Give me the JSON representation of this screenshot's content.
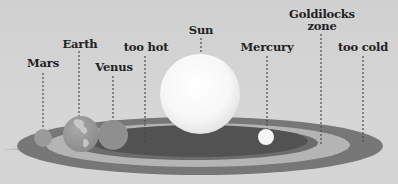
{
  "diagram": {
    "type": "solar-system-habitable-zone",
    "colors": {
      "background": "#d3d3d3",
      "outer_ring": "#787878",
      "goldilocks_band": "#b5b5b5",
      "inner_zone": "#545454",
      "sun": "#ffffff",
      "mercury": "#f4f4f4",
      "venus": "#8f8f8f",
      "earth": "#a0a0a0",
      "mars": "#9b9b9b",
      "leader_line": "#555555"
    },
    "labels": {
      "mars": "Mars",
      "earth": "Earth",
      "venus": "Venus",
      "too_hot": "too hot",
      "sun": "Sun",
      "mercury": "Mercury",
      "goldilocks_line1": "Goldilocks",
      "goldilocks_line2": "zone",
      "too_cold": "too cold"
    }
  }
}
